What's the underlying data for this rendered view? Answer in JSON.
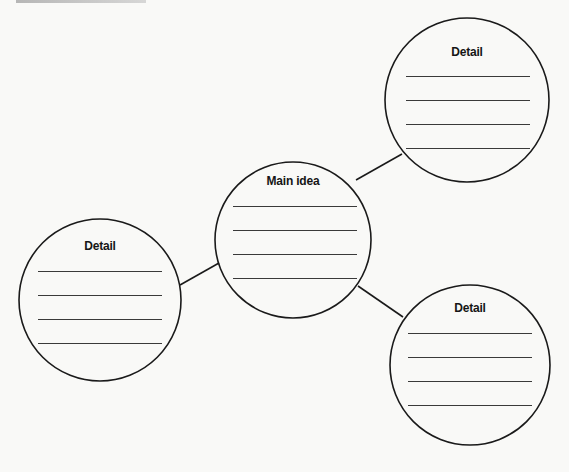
{
  "diagram": {
    "type": "idea-web",
    "background_color": "#f9f9f7",
    "stroke_color": "#1a1a1a",
    "nodes": [
      {
        "id": "main",
        "label": "Main idea",
        "cx": 293,
        "cy": 240,
        "r": 78,
        "label_y": 181,
        "lines_y": [
          206,
          230,
          254,
          278
        ],
        "line_x1": 233,
        "line_x2": 357
      },
      {
        "id": "detail-top-right",
        "label": "Detail",
        "cx": 467,
        "cy": 100,
        "r": 82,
        "label_y": 52,
        "lines_y": [
          76,
          100,
          124,
          148
        ],
        "line_x1": 406,
        "line_x2": 530
      },
      {
        "id": "detail-left",
        "label": "Detail",
        "cx": 100,
        "cy": 300,
        "r": 81,
        "label_y": 246,
        "lines_y": [
          271,
          295,
          319,
          343
        ],
        "line_x1": 38,
        "line_x2": 162
      },
      {
        "id": "detail-bottom-right",
        "label": "Detail",
        "cx": 470,
        "cy": 365,
        "r": 80,
        "label_y": 308,
        "lines_y": [
          333,
          357,
          381,
          405
        ],
        "line_x1": 408,
        "line_x2": 532
      }
    ],
    "connectors": [
      {
        "from": "main",
        "to": "detail-top-right",
        "x1": 356,
        "y1": 180,
        "x2": 402,
        "y2": 154
      },
      {
        "from": "main",
        "to": "detail-left",
        "x1": 219,
        "y1": 263,
        "x2": 180,
        "y2": 285
      },
      {
        "from": "main",
        "to": "detail-bottom-right",
        "x1": 358,
        "y1": 286,
        "x2": 403,
        "y2": 317
      }
    ]
  },
  "labels": {
    "main": "Main idea",
    "detail_top_right": "Detail",
    "detail_left": "Detail",
    "detail_bottom_right": "Detail"
  }
}
